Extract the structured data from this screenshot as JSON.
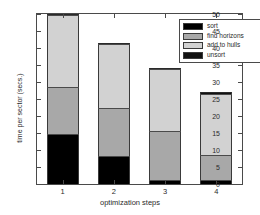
{
  "chart_data": {
    "type": "bar",
    "subtype": "stacked-bar",
    "title": "",
    "xlabel": "optimization steps",
    "ylabel": "time per sector (secs.)",
    "categories": [
      "1",
      "2",
      "3",
      "4"
    ],
    "ylim": [
      0,
      50
    ],
    "yticks": [
      0,
      5,
      10,
      15,
      20,
      25,
      30,
      35,
      40,
      45,
      50
    ],
    "ytick_labels": [
      "0",
      "5",
      "10",
      "15",
      "20",
      "25",
      "30",
      "35",
      "40",
      "45",
      "50"
    ],
    "grid": false,
    "legend_position": "top-right",
    "series": [
      {
        "name": "sort",
        "color": "#000000",
        "values": [
          14.3,
          8.0,
          0.8,
          0.8
        ]
      },
      {
        "name": "find horizons",
        "color": "#a8a8a8",
        "values": [
          13.9,
          14.2,
          14.4,
          7.5
        ]
      },
      {
        "name": "add to hulls",
        "color": "#d2d2d2",
        "values": [
          21.1,
          18.6,
          18.2,
          18.0
        ]
      },
      {
        "name": "unsort",
        "color": "#111111",
        "values": [
          0.7,
          0.7,
          0.8,
          0.7
        ]
      }
    ],
    "totals": [
      50.0,
      41.5,
      34.2,
      27.0
    ]
  },
  "legend": {
    "entries": [
      {
        "label": "sort",
        "color": "#000000"
      },
      {
        "label": "find horizons",
        "color": "#a8a8a8"
      },
      {
        "label": "add to hulls",
        "color": "#d2d2d2"
      },
      {
        "label": "unsort",
        "color": "#111111"
      }
    ]
  },
  "axes": {
    "x_title": "optimization steps",
    "y_title": "time per sector (secs.)"
  },
  "colors": {
    "axis": "#4a4a4a",
    "text": "#2b2b2b",
    "background": "#ffffff"
  }
}
